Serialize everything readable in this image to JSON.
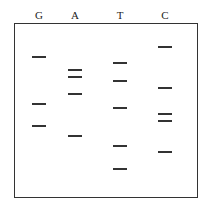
{
  "gel": {
    "lanes": [
      {
        "label": "G",
        "x": 39,
        "bands_y": [
          56,
          103,
          125
        ]
      },
      {
        "label": "A",
        "x": 75,
        "bands_y": [
          69,
          76,
          93,
          135
        ]
      },
      {
        "label": "T",
        "x": 120,
        "bands_y": [
          62,
          80,
          107,
          145,
          168
        ]
      },
      {
        "label": "C",
        "x": 165,
        "bands_y": [
          46,
          87,
          113,
          120,
          151
        ]
      }
    ],
    "band_color": "#333333"
  }
}
